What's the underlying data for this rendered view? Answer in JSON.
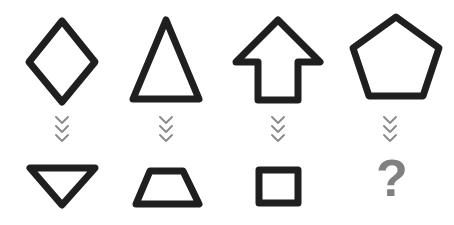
{
  "puzzle": {
    "type": "visual-analogy-shape-transformation",
    "background_color": "#ffffff",
    "stroke_color": "#1f1f1f",
    "chevron_color": "#8c8c8c",
    "placeholder_color": "#808080",
    "rows": 2,
    "columns": 4,
    "top_row_label": "top-shape-row",
    "bottom_row_label": "bottom-shape-row",
    "connector_label": "downward-chevrons",
    "columns_data": [
      {
        "index": 1,
        "top_shape_name": "diamond",
        "bottom_shape_name": "inverted-triangle",
        "connector": "three-down-chevrons",
        "is_answer_slot": false
      },
      {
        "index": 2,
        "top_shape_name": "triangle-up",
        "bottom_shape_name": "trapezoid",
        "connector": "three-down-chevrons",
        "is_answer_slot": false
      },
      {
        "index": 3,
        "top_shape_name": "up-arrow",
        "bottom_shape_name": "square",
        "connector": "three-down-chevrons",
        "is_answer_slot": false
      },
      {
        "index": 4,
        "top_shape_name": "pentagon",
        "bottom_shape_name": "question-mark-placeholder",
        "connector": "three-down-chevrons",
        "is_answer_slot": true
      }
    ],
    "placeholder_glyph": "?"
  }
}
